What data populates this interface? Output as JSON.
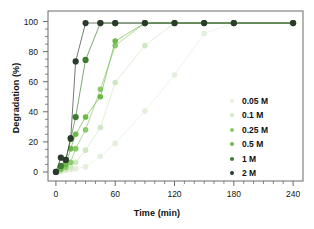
{
  "chart_data": {
    "type": "scatter",
    "title": "",
    "xlabel": "Time (min)",
    "ylabel": "Degradation (%)",
    "xlim": [
      -8,
      250
    ],
    "ylim": [
      -6,
      107
    ],
    "xticks": [
      0,
      60,
      120,
      180,
      240
    ],
    "yticks": [
      0,
      20,
      40,
      60,
      80,
      100
    ],
    "x_minor_tick_step": 10,
    "y_minor_tick_step": 5,
    "grid": false,
    "legend_position": "right-center",
    "series": [
      {
        "name": "0.05 M",
        "color": "#e3efdc",
        "x": [
          0,
          5,
          10,
          15,
          20,
          30,
          45,
          60,
          90,
          120,
          150,
          180,
          240
        ],
        "y": [
          0,
          0.5,
          1.0,
          1.6,
          2.2,
          3.5,
          10.5,
          19.0,
          40.5,
          64.5,
          92.0,
          99.0,
          99.0
        ]
      },
      {
        "name": "0.1 M",
        "color": "#cfe7c2",
        "x": [
          0,
          5,
          10,
          15,
          20,
          30,
          45,
          60,
          90,
          120,
          150,
          180,
          240
        ],
        "y": [
          0,
          1.0,
          2.0,
          3.2,
          6.5,
          14.5,
          29.5,
          59.5,
          84.0,
          99.0,
          99.0,
          99.0,
          99.0
        ]
      },
      {
        "name": "0.25 M",
        "color": "#8cc96a",
        "x": [
          0,
          5,
          10,
          15,
          20,
          30,
          45,
          60,
          90,
          120,
          150,
          180,
          240
        ],
        "y": [
          0,
          1.5,
          3.2,
          6.5,
          15.5,
          28.0,
          55.0,
          84.0,
          99.0,
          99.0,
          99.0,
          99.0,
          99.0
        ]
      },
      {
        "name": "0.5 M",
        "color": "#6cb94a",
        "x": [
          0,
          5,
          10,
          15,
          20,
          30,
          45,
          60,
          90,
          120,
          150,
          180,
          240
        ],
        "y": [
          0,
          2.5,
          5.0,
          15.5,
          25.0,
          36.5,
          50.0,
          87.0,
          99.0,
          99.0,
          99.0,
          99.0,
          99.0
        ]
      },
      {
        "name": "1 M",
        "color": "#3f7a33",
        "x": [
          0,
          5,
          10,
          15,
          20,
          30,
          45,
          60,
          90,
          120,
          150,
          180,
          240
        ],
        "y": [
          0,
          4.0,
          8.0,
          22.0,
          36.5,
          74.5,
          99.0,
          99.0,
          99.0,
          99.0,
          99.0,
          99.0,
          99.0
        ]
      },
      {
        "name": "2 M",
        "color": "#2b3b2b",
        "x": [
          0,
          5,
          10,
          15,
          20,
          30,
          45,
          60,
          90,
          120,
          150,
          180,
          240
        ],
        "y": [
          0,
          9.5,
          8.0,
          22.5,
          73.5,
          99.0,
          99.0,
          99.0,
          99.0,
          99.0,
          99.0,
          99.0,
          99.0
        ]
      }
    ]
  },
  "legend": {
    "items": [
      {
        "label": "0.05 M",
        "color": "#e3efdc"
      },
      {
        "label": "0.1 M",
        "color": "#cfe7c2"
      },
      {
        "label": "0.25 M",
        "color": "#8cc96a"
      },
      {
        "label": "0.5 M",
        "color": "#6cb94a"
      },
      {
        "label": "1 M",
        "color": "#3f7a33"
      },
      {
        "label": "2 M",
        "color": "#2b3b2b"
      }
    ]
  },
  "axes": {
    "x_title": "Time (min)",
    "y_title": "Degradation (%)",
    "x_tick_labels": [
      "0",
      "60",
      "120",
      "180",
      "240"
    ],
    "y_tick_labels": [
      "0",
      "20",
      "40",
      "60",
      "80",
      "100"
    ]
  },
  "style": {
    "spine_color": "#6b6b6b",
    "background": "#ffffff"
  }
}
